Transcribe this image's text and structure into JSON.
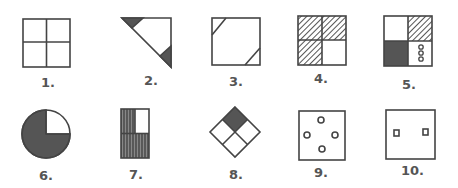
{
  "colors": {
    "stroke": "#444444",
    "fill_dark": "#555555",
    "background": "#ffffff",
    "label": "#555555"
  },
  "figures": [
    {
      "number": 1,
      "label": "1.",
      "description": "square divided into four equal quadrants, no shading"
    },
    {
      "number": 2,
      "label": "2.",
      "description": "right triangle (upper-right half of square) with two small shaded corner triangles at top-left and bottom-right tips"
    },
    {
      "number": 3,
      "label": "3.",
      "description": "square with small diagonal lines cutting off top-left and bottom-right corners"
    },
    {
      "number": 4,
      "label": "4.",
      "description": "square of four quadrants; top-left, top-right, bottom-left hatched; bottom-right blank"
    },
    {
      "number": 5,
      "label": "5.",
      "description": "square of four quadrants; top-left blank, top-right hatched, bottom-left solid dark, bottom-right with three small stacked circles"
    },
    {
      "number": 6,
      "label": "6.",
      "description": "circle shaded dark with upper-right quarter blank"
    },
    {
      "number": 7,
      "label": "7.",
      "description": "tall rectangle of four cells; top-right blank, remaining three vertically hatched"
    },
    {
      "number": 8,
      "label": "8.",
      "description": "diamond divided into four; top cell solid dark, others blank"
    },
    {
      "number": 9,
      "label": "9.",
      "description": "square with four small circles arranged top, left, right, bottom"
    },
    {
      "number": 10,
      "label": "10.",
      "description": "square with two small squares side by side at mid height"
    }
  ]
}
